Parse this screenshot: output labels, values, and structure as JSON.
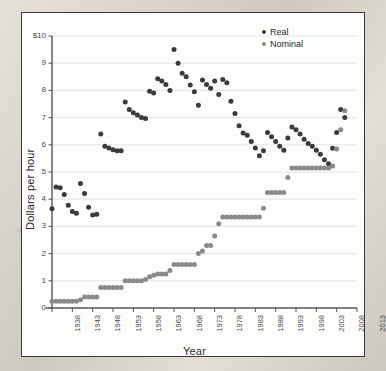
{
  "chart_data": {
    "type": "scatter",
    "title": "",
    "xlabel": "Year",
    "ylabel": "Dollars per hour",
    "xlim": [
      1938,
      2013
    ],
    "ylim": [
      0,
      10
    ],
    "xticks": [
      1938,
      1943,
      1948,
      1953,
      1958,
      1963,
      1968,
      1973,
      1978,
      1983,
      1988,
      1993,
      1998,
      2003,
      2008,
      2013
    ],
    "yticks": [
      "0",
      "1",
      "2",
      "3",
      "4",
      "5",
      "6",
      "7",
      "8",
      "9",
      "$10"
    ],
    "grid": true,
    "legend_position": "top-right",
    "colors": {
      "real": "#3b3b3b",
      "nominal": "#8a8a8a",
      "grid": "#e4e4e4",
      "axis": "#4a4a4a"
    },
    "series": [
      {
        "name": "Real",
        "color": "#3b3b3b",
        "points": [
          [
            1938,
            3.65
          ],
          [
            1939,
            4.45
          ],
          [
            1940,
            4.42
          ],
          [
            1941,
            4.17
          ],
          [
            1942,
            3.78
          ],
          [
            1943,
            3.55
          ],
          [
            1944,
            3.48
          ],
          [
            1945,
            4.58
          ],
          [
            1946,
            4.21
          ],
          [
            1947,
            3.7
          ],
          [
            1948,
            3.42
          ],
          [
            1949,
            3.45
          ],
          [
            1950,
            6.4
          ],
          [
            1951,
            5.95
          ],
          [
            1952,
            5.88
          ],
          [
            1953,
            5.82
          ],
          [
            1954,
            5.78
          ],
          [
            1955,
            5.78
          ],
          [
            1956,
            7.57
          ],
          [
            1957,
            7.3
          ],
          [
            1958,
            7.18
          ],
          [
            1959,
            7.1
          ],
          [
            1960,
            7.0
          ],
          [
            1961,
            6.97
          ],
          [
            1962,
            7.97
          ],
          [
            1963,
            7.9
          ],
          [
            1964,
            8.43
          ],
          [
            1965,
            8.35
          ],
          [
            1966,
            8.22
          ],
          [
            1967,
            8.0
          ],
          [
            1968,
            9.5
          ],
          [
            1969,
            9.0
          ],
          [
            1970,
            8.63
          ],
          [
            1971,
            8.5
          ],
          [
            1972,
            8.2
          ],
          [
            1973,
            7.95
          ],
          [
            1974,
            7.45
          ],
          [
            1975,
            8.38
          ],
          [
            1976,
            8.22
          ],
          [
            1977,
            8.08
          ],
          [
            1978,
            8.35
          ],
          [
            1979,
            7.85
          ],
          [
            1980,
            8.4
          ],
          [
            1981,
            8.28
          ],
          [
            1982,
            7.6
          ],
          [
            1983,
            7.15
          ],
          [
            1984,
            6.7
          ],
          [
            1985,
            6.43
          ],
          [
            1986,
            6.35
          ],
          [
            1987,
            6.12
          ],
          [
            1988,
            5.88
          ],
          [
            1989,
            5.6
          ],
          [
            1990,
            5.78
          ],
          [
            1991,
            6.45
          ],
          [
            1992,
            6.3
          ],
          [
            1993,
            6.12
          ],
          [
            1994,
            5.95
          ],
          [
            1995,
            5.8
          ],
          [
            1996,
            6.25
          ],
          [
            1997,
            6.65
          ],
          [
            1998,
            6.55
          ],
          [
            1999,
            6.4
          ],
          [
            2000,
            6.2
          ],
          [
            2001,
            6.05
          ],
          [
            2002,
            5.95
          ],
          [
            2003,
            5.8
          ],
          [
            2004,
            5.65
          ],
          [
            2005,
            5.45
          ],
          [
            2006,
            5.3
          ],
          [
            2007,
            5.87
          ],
          [
            2008,
            6.45
          ],
          [
            2009,
            7.3
          ],
          [
            2010,
            7.0
          ]
        ]
      },
      {
        "name": "Nominal",
        "color": "#8a8a8a",
        "points": [
          [
            1938,
            0.25
          ],
          [
            1939,
            0.25
          ],
          [
            1940,
            0.25
          ],
          [
            1941,
            0.25
          ],
          [
            1942,
            0.25
          ],
          [
            1943,
            0.25
          ],
          [
            1944,
            0.25
          ],
          [
            1945,
            0.3
          ],
          [
            1946,
            0.4
          ],
          [
            1947,
            0.4
          ],
          [
            1948,
            0.4
          ],
          [
            1949,
            0.4
          ],
          [
            1950,
            0.75
          ],
          [
            1951,
            0.75
          ],
          [
            1952,
            0.75
          ],
          [
            1953,
            0.75
          ],
          [
            1954,
            0.75
          ],
          [
            1955,
            0.75
          ],
          [
            1956,
            1.0
          ],
          [
            1957,
            1.0
          ],
          [
            1958,
            1.0
          ],
          [
            1959,
            1.0
          ],
          [
            1960,
            1.0
          ],
          [
            1961,
            1.05
          ],
          [
            1962,
            1.15
          ],
          [
            1963,
            1.2
          ],
          [
            1964,
            1.25
          ],
          [
            1965,
            1.25
          ],
          [
            1966,
            1.25
          ],
          [
            1967,
            1.38
          ],
          [
            1968,
            1.6
          ],
          [
            1969,
            1.6
          ],
          [
            1970,
            1.6
          ],
          [
            1971,
            1.6
          ],
          [
            1972,
            1.6
          ],
          [
            1973,
            1.6
          ],
          [
            1974,
            2.0
          ],
          [
            1975,
            2.1
          ],
          [
            1976,
            2.3
          ],
          [
            1977,
            2.3
          ],
          [
            1978,
            2.65
          ],
          [
            1979,
            3.1
          ],
          [
            1980,
            3.35
          ],
          [
            1981,
            3.35
          ],
          [
            1982,
            3.35
          ],
          [
            1983,
            3.35
          ],
          [
            1984,
            3.35
          ],
          [
            1985,
            3.35
          ],
          [
            1986,
            3.35
          ],
          [
            1987,
            3.35
          ],
          [
            1988,
            3.35
          ],
          [
            1989,
            3.35
          ],
          [
            1990,
            3.67
          ],
          [
            1991,
            4.25
          ],
          [
            1992,
            4.25
          ],
          [
            1993,
            4.25
          ],
          [
            1994,
            4.25
          ],
          [
            1995,
            4.25
          ],
          [
            1996,
            4.8
          ],
          [
            1997,
            5.15
          ],
          [
            1998,
            5.15
          ],
          [
            1999,
            5.15
          ],
          [
            2000,
            5.15
          ],
          [
            2001,
            5.15
          ],
          [
            2002,
            5.15
          ],
          [
            2003,
            5.15
          ],
          [
            2004,
            5.15
          ],
          [
            2005,
            5.15
          ],
          [
            2006,
            5.15
          ],
          [
            2007,
            5.22
          ],
          [
            2008,
            5.85
          ],
          [
            2009,
            6.55
          ],
          [
            2010,
            7.25
          ]
        ]
      }
    ]
  },
  "legend": {
    "entries": [
      {
        "label": "Real"
      },
      {
        "label": "Nominal"
      }
    ]
  },
  "axes": {
    "y_title": "Dollars per hour",
    "x_title": "Year"
  }
}
